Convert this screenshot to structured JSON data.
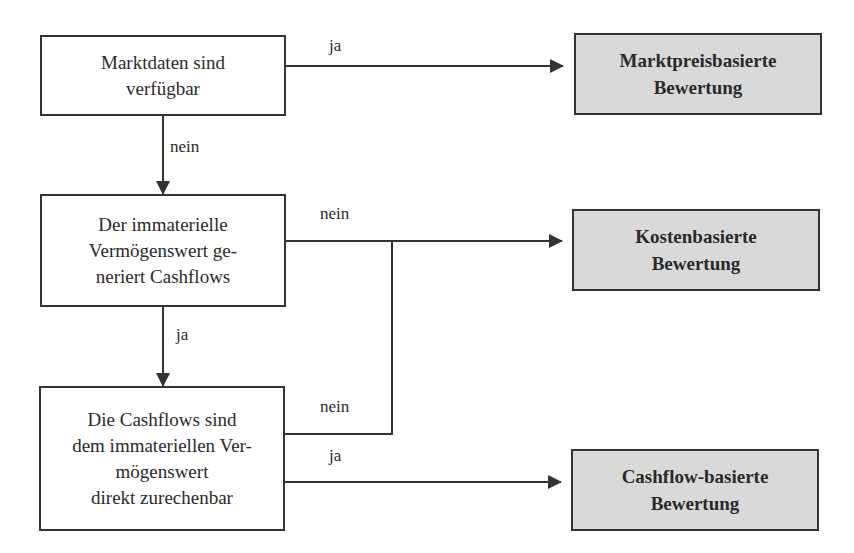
{
  "decisions": [
    {
      "id": "d1",
      "text": "Marktdaten sind\nverfügbar"
    },
    {
      "id": "d2",
      "text": "Der immaterielle\nVermögenswert ge-\nneriert Cashflows"
    },
    {
      "id": "d3",
      "text": "Die Cashflows sind\ndem immateriellen Ver-\nmögenswert\ndirekt zurechenbar"
    }
  ],
  "outcomes": [
    {
      "id": "o1",
      "text": "Marktpreisbasierte\nBewertung"
    },
    {
      "id": "o2",
      "text": "Kostenbasierte\nBewertung"
    },
    {
      "id": "o3",
      "text": "Cashflow-basierte\nBewertung"
    }
  ],
  "edges": [
    {
      "from": "d1",
      "to": "o1",
      "label": "ja"
    },
    {
      "from": "d1",
      "to": "d2",
      "label": "nein"
    },
    {
      "from": "d2",
      "to": "o2",
      "label": "nein"
    },
    {
      "from": "d2",
      "to": "d3",
      "label": "ja"
    },
    {
      "from": "d3",
      "to": "o2",
      "label": "nein"
    },
    {
      "from": "d3",
      "to": "o3",
      "label": "ja"
    }
  ],
  "colors": {
    "outcome_fill": "#d9d9d9",
    "line": "#333333"
  }
}
